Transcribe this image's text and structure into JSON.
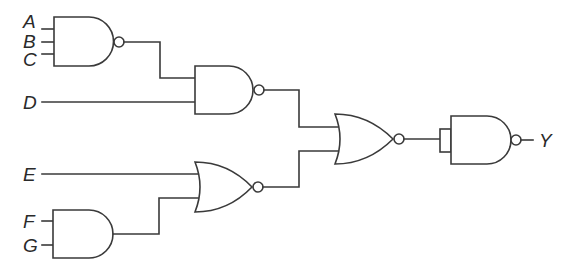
{
  "diagram": {
    "type": "logic-circuit",
    "inputs": [
      {
        "id": "A",
        "label": "A"
      },
      {
        "id": "B",
        "label": "B"
      },
      {
        "id": "C",
        "label": "C"
      },
      {
        "id": "D",
        "label": "D"
      },
      {
        "id": "E",
        "label": "E"
      },
      {
        "id": "F",
        "label": "F"
      },
      {
        "id": "G",
        "label": "G"
      }
    ],
    "output": {
      "id": "Y",
      "label": "Y"
    },
    "gates": [
      {
        "id": "g1",
        "type": "NAND",
        "inputs": [
          "A",
          "B",
          "C"
        ]
      },
      {
        "id": "g2",
        "type": "NAND",
        "inputs": [
          "g1",
          "D"
        ]
      },
      {
        "id": "g3",
        "type": "AND",
        "inputs": [
          "F",
          "G"
        ]
      },
      {
        "id": "g4",
        "type": "NOR",
        "inputs": [
          "E",
          "g3"
        ]
      },
      {
        "id": "g5",
        "type": "NOR",
        "inputs": [
          "g2",
          "g4"
        ]
      },
      {
        "id": "g6",
        "type": "NAND",
        "inputs": [
          "g5",
          "g5"
        ],
        "note": "tied inputs"
      }
    ],
    "colors": {
      "line": "#3a3a3a",
      "text": "#2a2a2a",
      "background": "#ffffff"
    }
  }
}
